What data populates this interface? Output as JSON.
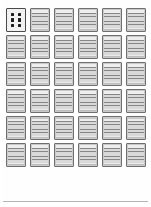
{
  "page": {
    "kind": "thumbnail-contact-sheet",
    "background_color": "#fefefe",
    "width": 151,
    "height": 207,
    "columns": 6,
    "rows": 6,
    "total_thumbnails": 36
  },
  "style": {
    "card_fill": "#c9c9c9",
    "card_border": "#6f6f6f",
    "dot_color": "#1d1d1d",
    "first_card_fill": "#f2f2f2",
    "rule_color": "#b4b4b4"
  },
  "first_card": {
    "label": "",
    "dot_count": 6,
    "dot_columns": 2,
    "dot_rows": 3,
    "dots": [
      "",
      "",
      "",
      "",
      "",
      ""
    ]
  },
  "thumbnails": [
    {
      "index": 1,
      "type": "dots",
      "texture": "dots"
    },
    {
      "index": 2,
      "type": "page",
      "texture": "rows"
    },
    {
      "index": 3,
      "type": "page",
      "texture": "grid"
    },
    {
      "index": 4,
      "type": "page",
      "texture": "grid"
    },
    {
      "index": 5,
      "type": "page",
      "texture": "grid"
    },
    {
      "index": 6,
      "type": "page",
      "texture": "rows"
    },
    {
      "index": 7,
      "type": "page",
      "texture": "rows"
    },
    {
      "index": 8,
      "type": "page",
      "texture": "grid"
    },
    {
      "index": 9,
      "type": "page",
      "texture": "rows"
    },
    {
      "index": 10,
      "type": "page",
      "texture": "grid"
    },
    {
      "index": 11,
      "type": "page",
      "texture": "rows"
    },
    {
      "index": 12,
      "type": "page",
      "texture": "rows"
    },
    {
      "index": 13,
      "type": "page",
      "texture": "rows"
    },
    {
      "index": 14,
      "type": "page",
      "texture": "grid"
    },
    {
      "index": 15,
      "type": "page",
      "texture": "grid"
    },
    {
      "index": 16,
      "type": "page",
      "texture": "grid"
    },
    {
      "index": 17,
      "type": "page",
      "texture": "rows"
    },
    {
      "index": 18,
      "type": "page",
      "texture": "grid"
    },
    {
      "index": 19,
      "type": "page",
      "texture": "rows"
    },
    {
      "index": 20,
      "type": "page",
      "texture": "grid"
    },
    {
      "index": 21,
      "type": "page",
      "texture": "grid"
    },
    {
      "index": 22,
      "type": "page",
      "texture": "grid"
    },
    {
      "index": 23,
      "type": "page",
      "texture": "rows"
    },
    {
      "index": 24,
      "type": "page",
      "texture": "rows"
    },
    {
      "index": 25,
      "type": "page",
      "texture": "rows"
    },
    {
      "index": 26,
      "type": "page",
      "texture": "grid"
    },
    {
      "index": 27,
      "type": "page",
      "texture": "grid"
    },
    {
      "index": 28,
      "type": "page",
      "texture": "grid"
    },
    {
      "index": 29,
      "type": "page",
      "texture": "rows"
    },
    {
      "index": 30,
      "type": "page",
      "texture": "grid"
    },
    {
      "index": 31,
      "type": "page",
      "texture": "rows"
    },
    {
      "index": 32,
      "type": "page",
      "texture": "rows"
    },
    {
      "index": 33,
      "type": "page",
      "texture": "grid"
    },
    {
      "index": 34,
      "type": "page",
      "texture": "grid"
    },
    {
      "index": 35,
      "type": "page",
      "texture": "rows"
    },
    {
      "index": 36,
      "type": "page",
      "texture": "rows"
    }
  ],
  "footer": {
    "has_rule": true,
    "text": ""
  }
}
